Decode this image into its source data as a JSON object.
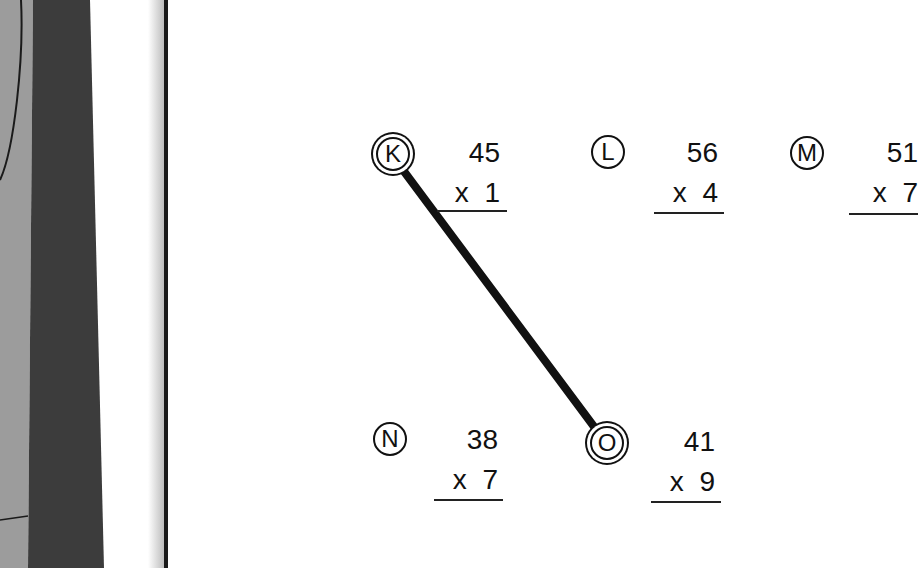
{
  "worksheet": {
    "problems": [
      {
        "label": "K",
        "top": "45",
        "multiplier_sign": "x",
        "bottom": "1",
        "selected": true
      },
      {
        "label": "L",
        "top": "56",
        "multiplier_sign": "x",
        "bottom": "4",
        "selected": false
      },
      {
        "label": "M",
        "top": "51",
        "multiplier_sign": "x",
        "bottom": "7",
        "selected": false
      },
      {
        "label": "N",
        "top": "38",
        "multiplier_sign": "x",
        "bottom": "7",
        "selected": false
      },
      {
        "label": "O",
        "top": "41",
        "multiplier_sign": "x",
        "bottom": "9",
        "selected": true
      }
    ],
    "connection": {
      "from": "K",
      "to": "O"
    }
  },
  "colors": {
    "ink": "#111111",
    "binding_light": "#9a9a9a",
    "binding_dark": "#3a3a3a",
    "paper": "#ffffff"
  }
}
